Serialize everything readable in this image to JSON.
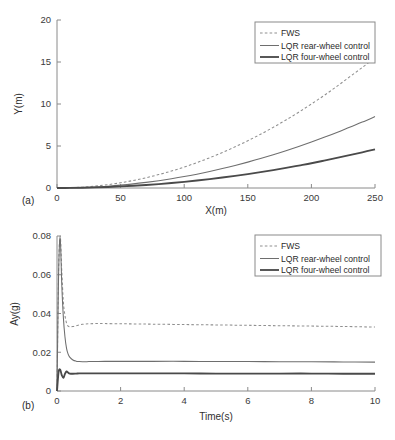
{
  "figure": {
    "background": "#ffffff",
    "ink": "#2b2b2b"
  },
  "panels": [
    {
      "tag": "(a)",
      "tag_name": "panel-tag-a"
    },
    {
      "tag": "(b)",
      "tag_name": "panel-tag-b"
    }
  ],
  "legend": {
    "entries": [
      {
        "label": "FWS",
        "style": "dashed",
        "color": "#8f8f8f"
      },
      {
        "label": "LQR rear-wheel control",
        "style": "solid-thin",
        "color": "#6e6e6e"
      },
      {
        "label": "LQR four-wheel control",
        "style": "solid-thick",
        "color": "#4a4a4a"
      }
    ]
  },
  "chart_data": [
    {
      "type": "line",
      "id": "trajectory",
      "panel": "(a)",
      "title": "",
      "xlabel": "X(m)",
      "ylabel": "Y(m)",
      "xlim": [
        0,
        250
      ],
      "ylim": [
        0,
        20
      ],
      "xticks": [
        0,
        50,
        100,
        150,
        200,
        250
      ],
      "yticks": [
        0,
        5,
        10,
        15,
        20
      ],
      "xticklabels": [
        "0",
        "50",
        "100",
        "150",
        "200",
        "250"
      ],
      "yticklabels": [
        "0",
        "5",
        "10",
        "15",
        "20"
      ],
      "grid": false,
      "legend_position": "upper-right",
      "x": [
        0,
        10,
        20,
        30,
        40,
        50,
        60,
        70,
        80,
        90,
        100,
        110,
        120,
        130,
        140,
        150,
        160,
        170,
        180,
        190,
        200,
        210,
        220,
        230,
        240,
        250
      ],
      "series": [
        {
          "name": "FWS",
          "style": "dashed",
          "color": "#8f8f8f",
          "values": [
            0.0,
            0.03,
            0.1,
            0.22,
            0.4,
            0.62,
            0.9,
            1.22,
            1.6,
            2.02,
            2.5,
            3.02,
            3.6,
            4.22,
            4.9,
            5.62,
            6.4,
            7.22,
            8.1,
            9.02,
            10.0,
            11.02,
            12.1,
            13.22,
            14.35,
            15.5
          ]
        },
        {
          "name": "LQR rear-wheel control",
          "style": "solid-thin",
          "color": "#6e6e6e",
          "values": [
            0.0,
            0.015,
            0.055,
            0.12,
            0.22,
            0.34,
            0.49,
            0.67,
            0.87,
            1.1,
            1.36,
            1.65,
            1.97,
            2.31,
            2.68,
            3.08,
            3.5,
            3.95,
            4.43,
            4.94,
            5.47,
            6.03,
            6.62,
            7.24,
            7.85,
            8.5
          ]
        },
        {
          "name": "LQR four-wheel control",
          "style": "solid-thick",
          "color": "#4a4a4a",
          "values": [
            0.0,
            0.008,
            0.03,
            0.066,
            0.118,
            0.184,
            0.265,
            0.36,
            0.47,
            0.595,
            0.735,
            0.89,
            1.06,
            1.25,
            1.45,
            1.66,
            1.89,
            2.13,
            2.39,
            2.67,
            2.95,
            3.26,
            3.58,
            3.91,
            4.25,
            4.6
          ]
        }
      ]
    },
    {
      "type": "line",
      "id": "lateral-acceleration",
      "panel": "(b)",
      "title": "",
      "xlabel": "Time(s)",
      "ylabel": "Ay(g)",
      "xlim": [
        0,
        10
      ],
      "ylim": [
        0,
        0.08
      ],
      "xticks": [
        0,
        2,
        4,
        6,
        8,
        10
      ],
      "yticks": [
        0,
        0.02,
        0.04,
        0.06,
        0.08
      ],
      "xticklabels": [
        "0",
        "2",
        "4",
        "6",
        "8",
        "10"
      ],
      "yticklabels": [
        "0",
        "0.02",
        "0.04",
        "0.06",
        "0.08"
      ],
      "grid": false,
      "legend_position": "upper-right",
      "x": [
        0,
        0.05,
        0.1,
        0.15,
        0.2,
        0.25,
        0.3,
        0.35,
        0.4,
        0.5,
        0.6,
        0.7,
        0.8,
        0.9,
        1.0,
        1.2,
        1.5,
        2.0,
        2.5,
        3.0,
        4.0,
        5.0,
        6.0,
        7.0,
        8.0,
        9.0,
        10.0
      ],
      "series": [
        {
          "name": "FWS",
          "style": "dashed",
          "color": "#8f8f8f",
          "steady_state": 0.0335,
          "peak": 0.08,
          "values": [
            0.0,
            0.062,
            0.08,
            0.062,
            0.046,
            0.039,
            0.035,
            0.0335,
            0.0332,
            0.0333,
            0.0337,
            0.0341,
            0.0344,
            0.0346,
            0.0347,
            0.0348,
            0.0348,
            0.0347,
            0.0346,
            0.0345,
            0.0343,
            0.0341,
            0.0339,
            0.0337,
            0.0335,
            0.0333,
            0.033
          ]
        },
        {
          "name": "LQR rear-wheel control",
          "style": "solid-thin",
          "color": "#6e6e6e",
          "steady_state": 0.015,
          "peak": 0.08,
          "values": [
            0.0,
            0.06,
            0.079,
            0.055,
            0.038,
            0.028,
            0.022,
            0.019,
            0.0175,
            0.016,
            0.0154,
            0.0152,
            0.0151,
            0.0151,
            0.0152,
            0.0152,
            0.0153,
            0.0153,
            0.0153,
            0.0153,
            0.0153,
            0.0152,
            0.0152,
            0.0151,
            0.0151,
            0.015,
            0.0149
          ]
        },
        {
          "name": "LQR four-wheel control",
          "style": "solid-thick",
          "color": "#4a4a4a",
          "steady_state": 0.009,
          "peak": 0.0115,
          "values": [
            0.0,
            0.0098,
            0.011,
            0.0082,
            0.0068,
            0.0088,
            0.0101,
            0.0095,
            0.009,
            0.0089,
            0.009,
            0.0091,
            0.0091,
            0.0091,
            0.0091,
            0.0091,
            0.0091,
            0.0091,
            0.0091,
            0.0091,
            0.0091,
            0.009,
            0.009,
            0.009,
            0.009,
            0.0089,
            0.0089
          ]
        }
      ]
    }
  ]
}
